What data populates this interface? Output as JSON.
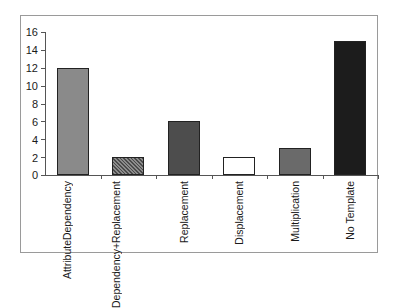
{
  "chart_data": {
    "type": "bar",
    "title": "",
    "xlabel": "",
    "ylabel": "",
    "ylim": [
      0,
      16
    ],
    "yticks": [
      0,
      2,
      4,
      6,
      8,
      10,
      12,
      14,
      16
    ],
    "grid": false,
    "legend": null,
    "categories": [
      "Attribute Dependency",
      "Dependency + Replacement",
      "Replacement",
      "Displacement",
      "Multiplication",
      "No Template"
    ],
    "category_label_lines": [
      [
        "Attribute",
        "Dependency"
      ],
      [
        "Dependency",
        "+",
        "Replacement"
      ],
      [
        "Replacement"
      ],
      [
        "Displacement"
      ],
      [
        "Multiplication"
      ],
      [
        "No Template"
      ]
    ],
    "values": [
      12,
      2,
      6,
      2,
      3,
      15
    ],
    "bar_colors": [
      "#8a8a8a",
      "hatched-gray",
      "#4d4d4d",
      "#ffffff",
      "#6a6a6a",
      "#1c1c1c"
    ]
  },
  "yaxis": {
    "labels": [
      "16",
      "14",
      "12",
      "10",
      "8",
      "6",
      "4",
      "2",
      "0"
    ]
  }
}
